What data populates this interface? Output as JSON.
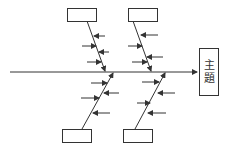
{
  "diagram": {
    "type": "fishbone",
    "head": {
      "lines": [
        "主",
        "題"
      ]
    },
    "cause_boxes": [
      {
        "position": "top-left",
        "label": ""
      },
      {
        "position": "top-right",
        "label": ""
      },
      {
        "position": "bottom-left",
        "label": ""
      },
      {
        "position": "bottom-right",
        "label": ""
      }
    ],
    "colors": {
      "line": "#333333",
      "background": "#ffffff"
    }
  }
}
